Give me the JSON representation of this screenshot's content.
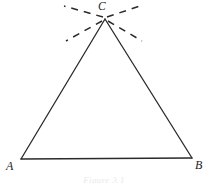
{
  "figure": {
    "kind": "geometry-diagram",
    "background_color": "#ffffff",
    "stroke_color": "#2a2a2a",
    "label_color": "#232323",
    "caption": "Figure 3.1",
    "caption_color": "#e9e9e9",
    "vertices": [
      {
        "name": "A",
        "label": "A",
        "x": 21,
        "y": 159
      },
      {
        "name": "B",
        "label": "B",
        "x": 192,
        "y": 158
      },
      {
        "name": "C",
        "label": "C",
        "x": 105,
        "y": 19
      }
    ],
    "edges": [
      {
        "name": "side-AC",
        "from": "A",
        "to": "C",
        "style": "solid",
        "width": 1.3
      },
      {
        "name": "side-CB",
        "from": "C",
        "to": "B",
        "style": "solid",
        "width": 1.3
      },
      {
        "name": "side-AB",
        "from": "A",
        "to": "B",
        "style": "solid",
        "width": 1.3
      }
    ],
    "rays": [
      {
        "name": "ray-upper-left",
        "x1": 103,
        "y1": 17,
        "x2": 64,
        "y2": 6,
        "style": "dashed",
        "width": 1.5
      },
      {
        "name": "ray-upper-right",
        "x1": 107,
        "y1": 17,
        "x2": 143,
        "y2": 5,
        "style": "dashed",
        "width": 1.5
      },
      {
        "name": "ray-lower-left",
        "x1": 102,
        "y1": 21,
        "x2": 66,
        "y2": 41,
        "style": "dashed",
        "width": 1.5
      },
      {
        "name": "ray-lower-right",
        "x1": 108,
        "y1": 21,
        "x2": 142,
        "y2": 41,
        "style": "dashed",
        "width": 1.5
      }
    ]
  }
}
